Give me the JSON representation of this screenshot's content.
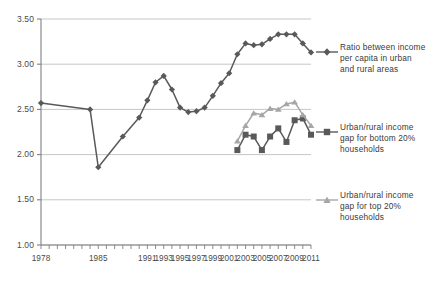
{
  "chart_data": {
    "type": "line",
    "title": "",
    "subtitle": "",
    "xlabel": "",
    "ylabel": "",
    "grid": true,
    "legend_position": "right",
    "xlim": [
      1978,
      2011
    ],
    "ylim": [
      1.0,
      3.5
    ],
    "y_ticks": [
      "1.00",
      "1.50",
      "2.00",
      "2.50",
      "3.00",
      "3.50"
    ],
    "y_tick_values": [
      1.0,
      1.5,
      2.0,
      2.5,
      3.0,
      3.5
    ],
    "x_tick_labels": [
      "1978",
      "1985",
      "1991",
      "1993",
      "1995",
      "1997",
      "1999",
      "2001",
      "2003",
      "2005",
      "2007",
      "2009",
      "2011"
    ],
    "colors": {
      "series_ratio": "#595959",
      "series_bottom20": "#595959",
      "series_top20": "#a6a6a6",
      "gridline": "#bfbfbf",
      "axis": "#808080",
      "text": "#404040"
    },
    "series": [
      {
        "name": "Ratio between income per capita in urban and rural areas",
        "marker": "diamond",
        "color": "#595959",
        "x": [
          1978,
          1984,
          1985,
          1988,
          1990,
          1991,
          1992,
          1993,
          1994,
          1995,
          1996,
          1997,
          1998,
          1999,
          2000,
          2001,
          2002,
          2003,
          2004,
          2005,
          2006,
          2007,
          2008,
          2009,
          2010,
          2011
        ],
        "values": [
          2.57,
          2.5,
          1.86,
          2.2,
          2.41,
          2.6,
          2.8,
          2.87,
          2.72,
          2.52,
          2.47,
          2.48,
          2.52,
          2.65,
          2.79,
          2.9,
          3.11,
          3.23,
          3.21,
          3.22,
          3.28,
          3.33,
          3.33,
          3.33,
          3.23,
          3.13
        ]
      },
      {
        "name": "Urban/rural income gap for bottom 20% households",
        "marker": "square",
        "color": "#595959",
        "x": [
          2002,
          2003,
          2004,
          2005,
          2006,
          2007,
          2008,
          2009,
          2010,
          2011
        ],
        "values": [
          2.05,
          2.22,
          2.2,
          2.05,
          2.2,
          2.29,
          2.14,
          2.38,
          2.4,
          2.22
        ]
      },
      {
        "name": "Urban/rural income gap for top 20% households",
        "marker": "triangle",
        "color": "#a6a6a6",
        "x": [
          2002,
          2003,
          2004,
          2005,
          2006,
          2007,
          2008,
          2009,
          2010,
          2011
        ],
        "values": [
          2.15,
          2.32,
          2.46,
          2.44,
          2.51,
          2.5,
          2.56,
          2.58,
          2.44,
          2.32
        ]
      }
    ]
  },
  "legend": {
    "entries": [
      {
        "label": "Ratio between income\nper capita in urban\nand rural areas",
        "marker": "diamond",
        "color": "#595959"
      },
      {
        "label": "Urban/rural income\ngap for bottom 20%\nhouseholds",
        "marker": "square",
        "color": "#595959"
      },
      {
        "label": "Urban/rural income\ngap for top 20%\nhouseholds",
        "marker": "triangle",
        "color": "#a6a6a6"
      }
    ]
  }
}
